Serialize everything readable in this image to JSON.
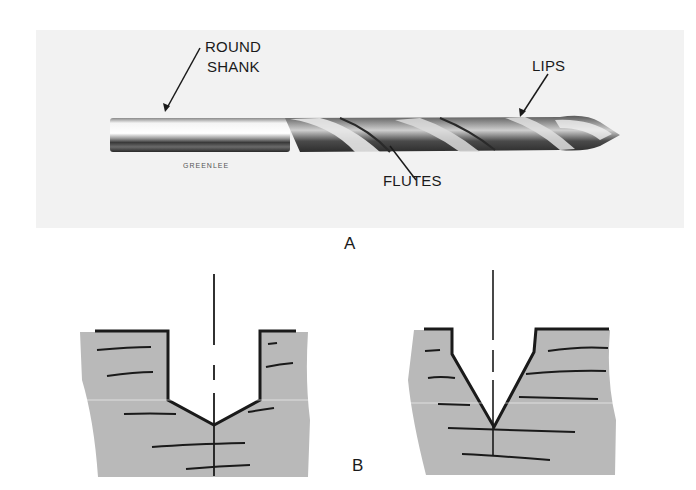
{
  "figure_a": {
    "panel_label": "A",
    "brand_text": "GREENLEE",
    "callouts": {
      "round_shank_line1": "ROUND",
      "round_shank_line2": "SHANK",
      "lips": "LIPS",
      "flutes": "FLUTES"
    }
  },
  "figure_b": {
    "panel_label": "B",
    "left_hole": "flat-bottom bore with shallow conical point",
    "right_hole": "steep conical point"
  },
  "colors": {
    "material_fill": "#b9b9b9",
    "outline": "#1a1a1a",
    "photo_bg": "#f2f2f2"
  }
}
